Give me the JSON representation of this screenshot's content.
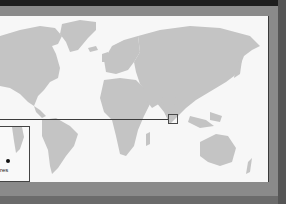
{
  "map": {
    "type": "world-locator-map",
    "land_color": "#c4c4c4",
    "ocean_color": "#f7f7f7",
    "frame_color": "#8a8a8a",
    "highlight_marker": {
      "region": "south-of-india",
      "shape": "square"
    },
    "inset": {
      "label": "res",
      "has_point_marker": true
    }
  }
}
